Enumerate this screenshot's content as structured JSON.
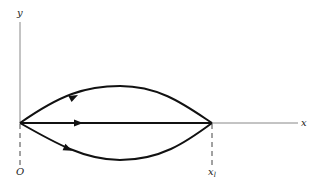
{
  "diagram": {
    "axes": {
      "y_label": "y",
      "x_label": "x",
      "origin_label": "O",
      "end_label_main": "x",
      "end_label_sub": "l"
    },
    "paths": [
      {
        "name": "upper-path",
        "description": "curved path above x-axis from O to x_l",
        "arrow": true
      },
      {
        "name": "straight-path",
        "description": "straight path along x-axis from O to x_l",
        "arrow": true
      },
      {
        "name": "lower-path",
        "description": "curved path below x-axis from O to x_l",
        "arrow": true
      }
    ],
    "colors": {
      "axis": "#888888",
      "path": "#111111"
    }
  }
}
